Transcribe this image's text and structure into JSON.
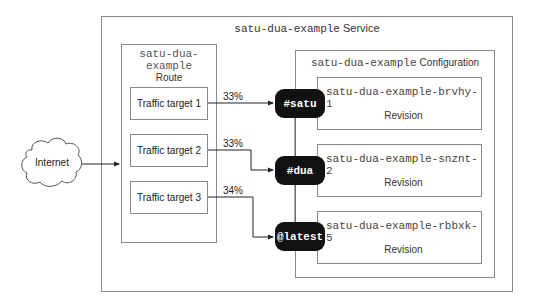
{
  "diagram": {
    "service": {
      "name": "satu-dua-example",
      "kind": "Service"
    },
    "internet": {
      "label": "Internet",
      "icon": "cloud-icon"
    },
    "route": {
      "name_line1": "satu-dua-",
      "name_line2": "example",
      "kind": "Route",
      "targets": [
        {
          "label": "Traffic target 1",
          "percent": "33%"
        },
        {
          "label": "Traffic target 2",
          "percent": "33%"
        },
        {
          "label": "Traffic target 3",
          "percent": "34%"
        }
      ]
    },
    "configuration": {
      "name": "satu-dua-example",
      "kind": "Configuration",
      "revisions": [
        {
          "tag": "#satu",
          "name": "satu-dua-example-brvhy-1",
          "kind": "Revision"
        },
        {
          "tag": "#dua",
          "name": "satu-dua-example-snznt-2",
          "kind": "Revision"
        },
        {
          "tag": "@latest",
          "name": "satu-dua-example-rbbxk-5",
          "kind": "Revision"
        }
      ]
    },
    "colors": {
      "border": "#8a8a8a",
      "tag_bg": "#111111",
      "tag_fg": "#ffffff",
      "line": "#333333"
    }
  }
}
